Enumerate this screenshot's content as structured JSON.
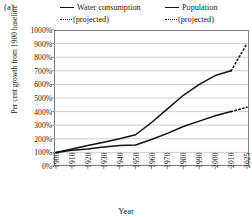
{
  "panel": {
    "label": "(a)"
  },
  "legend": {
    "entries": [
      {
        "name": "Water consumption",
        "solid_label": "Water consumption",
        "projected_label": "(projected)"
      },
      {
        "name": "Population",
        "solid_label": "Population",
        "projected_label": "(projected)"
      }
    ]
  },
  "axes": {
    "ylabel": "Per cent growth from 1900 baseline",
    "xlabel": "Year"
  },
  "colors": {
    "line": "#111111",
    "grid": "#b9b9b9",
    "frame": "#7d7d7d",
    "background": "#ffffff"
  },
  "chart_data": {
    "type": "line",
    "title": "",
    "xlabel": "Year",
    "ylabel": "Per cent growth from 1900 baseline",
    "categories": [
      "1900",
      "1910",
      "1920",
      "1930",
      "1940",
      "1950",
      "1960",
      "1970",
      "1980",
      "1990",
      "2000",
      "2010",
      "2025"
    ],
    "x": [
      1900,
      1910,
      1920,
      1930,
      1940,
      1950,
      1960,
      1970,
      1980,
      1990,
      2000,
      2010,
      2025
    ],
    "ytick_labels": [
      "0%",
      "100%",
      "200%",
      "300%",
      "400%",
      "500%",
      "600%",
      "700%",
      "800%",
      "900%",
      "1000%"
    ],
    "ytick_values": [
      0,
      100,
      200,
      300,
      400,
      500,
      600,
      700,
      800,
      900,
      1000
    ],
    "ylim": [
      0,
      1000
    ],
    "grid": true,
    "legend_position": "top",
    "series": [
      {
        "name": "Water consumption",
        "style": "solid",
        "values": [
          100,
          125,
          150,
          175,
          200,
          230,
          320,
          420,
          520,
          600,
          665,
          700,
          null
        ],
        "projected": {
          "style": "dotted",
          "label": "(projected)",
          "x": [
            2010,
            2025
          ],
          "values": [
            700,
            900
          ]
        }
      },
      {
        "name": "Population",
        "style": "solid",
        "values": [
          100,
          115,
          125,
          140,
          150,
          155,
          195,
          240,
          290,
          330,
          370,
          400,
          null
        ],
        "projected": {
          "style": "dotted",
          "label": "(projected)",
          "x": [
            2010,
            2025
          ],
          "values": [
            400,
            432
          ]
        }
      }
    ]
  }
}
